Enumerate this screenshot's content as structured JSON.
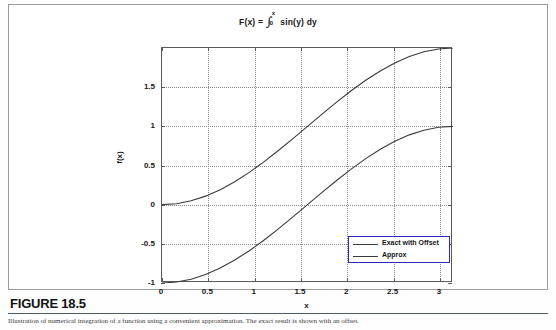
{
  "figure": {
    "number_label": "FIGURE 18.5",
    "caption_text": "Illustration of numerical integration of a function using a convenient approximation. The exact result is shown with an offset.",
    "frame_color": "#9b9b9b",
    "rule_color": "#4b5c6b"
  },
  "chart_data": {
    "type": "line",
    "title": "F(x) =",
    "title_integral": {
      "symbol": "∫",
      "upper_limit": "x",
      "lower_limit": "0",
      "integrand": "sin(y) dy"
    },
    "title_full": "F(x) =  ∫₀ˣ sin(y) dy",
    "xlabel": "x",
    "ylabel": "f(x)",
    "xlim": [
      0,
      3.14159
    ],
    "ylim": [
      -1,
      2
    ],
    "xticks": [
      0,
      0.5,
      1,
      1.5,
      2,
      2.5,
      3
    ],
    "xtick_labels": [
      "0",
      "0.5",
      "1",
      "1.5",
      "2",
      "2.5",
      "3"
    ],
    "yticks": [
      -1,
      -0.5,
      0,
      0.5,
      1,
      1.5
    ],
    "ytick_labels": [
      "-1",
      "-0.5",
      "0",
      "0.5",
      "1",
      "1.5"
    ],
    "grid": true,
    "grid_style": "dotted",
    "legend_position": "lower-right",
    "line_color": "#3a3a3a",
    "series": [
      {
        "name": "Exact with Offset",
        "formula": "1 - cos(x)",
        "x": [
          0,
          0.1571,
          0.3142,
          0.4712,
          0.6283,
          0.7854,
          0.9425,
          1.0996,
          1.2566,
          1.4137,
          1.5708,
          1.7279,
          1.885,
          2.042,
          2.1991,
          2.3562,
          2.5133,
          2.6704,
          2.8274,
          2.9845,
          3.1416
        ],
        "values": [
          0.0,
          0.0123,
          0.0489,
          0.109,
          0.191,
          0.2929,
          0.4122,
          0.546,
          0.691,
          0.8436,
          1.0,
          1.1564,
          1.309,
          1.454,
          1.5878,
          1.7071,
          1.809,
          1.891,
          1.9511,
          1.9877,
          2.0
        ]
      },
      {
        "name": "Approx",
        "formula": "-cos(x)",
        "x": [
          0,
          0.1571,
          0.3142,
          0.4712,
          0.6283,
          0.7854,
          0.9425,
          1.0996,
          1.2566,
          1.4137,
          1.5708,
          1.7279,
          1.885,
          2.042,
          2.1991,
          2.3562,
          2.5133,
          2.6704,
          2.8274,
          2.9845,
          3.1416
        ],
        "values": [
          -1.0,
          -0.9877,
          -0.9511,
          -0.891,
          -0.809,
          -0.7071,
          -0.5878,
          -0.454,
          -0.309,
          -0.1564,
          0.0,
          0.1564,
          0.309,
          0.454,
          0.5878,
          0.7071,
          0.809,
          0.891,
          0.9511,
          0.9877,
          1.0
        ]
      }
    ],
    "legend": [
      {
        "label": "Exact with Offset"
      },
      {
        "label": "Approx"
      }
    ]
  }
}
